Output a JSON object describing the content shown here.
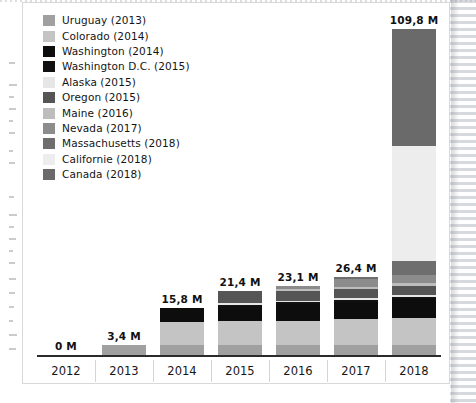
{
  "chart_data": {
    "type": "bar",
    "subtype": "stacked-bar",
    "title": "",
    "xlabel": "",
    "ylabel": "",
    "grid": false,
    "legend_position": "top-left",
    "ylim": [
      0,
      109.8
    ],
    "unit_suffix": " M",
    "decimal_separator": ",",
    "categories": [
      "2012",
      "2013",
      "2014",
      "2015",
      "2016",
      "2017",
      "2018"
    ],
    "totals": [
      0,
      3.4,
      15.8,
      21.4,
      23.1,
      26.4,
      109.8
    ],
    "total_labels": [
      "0 M",
      "3,4 M",
      "15,8 M",
      "21,4 M",
      "23,1 M",
      "26,4 M",
      "109,8 M"
    ],
    "series": [
      {
        "name": "Uruguay (2013)",
        "color": "#a0a0a0",
        "values": [
          0,
          3.4,
          3.4,
          3.4,
          3.4,
          3.4,
          3.4
        ]
      },
      {
        "name": "Colorado (2014)",
        "color": "#c4c4c4",
        "values": [
          0,
          0,
          7.6,
          7.9,
          8.2,
          8.6,
          9.0
        ]
      },
      {
        "name": "Washington (2014)",
        "color": "#0d0d0d",
        "values": [
          0,
          0,
          4.8,
          5.2,
          5.6,
          6.0,
          6.4
        ]
      },
      {
        "name": "Washington D.C. (2015)",
        "color": "#111111",
        "values": [
          0,
          0,
          0,
          0.5,
          0.5,
          0.5,
          0.6
        ]
      },
      {
        "name": "Alaska (2015)",
        "color": "#e6e6e6",
        "values": [
          0,
          0,
          0,
          0.5,
          0.6,
          0.7,
          0.8
        ]
      },
      {
        "name": "Oregon (2015)",
        "color": "#555555",
        "values": [
          0,
          0,
          0,
          3.9,
          3.4,
          3.1,
          3.2
        ]
      },
      {
        "name": "Maine (2016)",
        "color": "#bdbdbd",
        "values": [
          0,
          0,
          0,
          0,
          0.5,
          0.6,
          0.7
        ]
      },
      {
        "name": "Nevada (2017)",
        "color": "#8c8c8c",
        "values": [
          0,
          0,
          0,
          0,
          0.9,
          2.6,
          2.8
        ]
      },
      {
        "name": "Massachusetts (2018)",
        "color": "#6e6e6e",
        "values": [
          0,
          0,
          0,
          0,
          0,
          0.9,
          4.6
        ]
      },
      {
        "name": "Californie (2018)",
        "color": "#ededed",
        "values": [
          0,
          0,
          0,
          0,
          0,
          0,
          39.0
        ]
      },
      {
        "name": "Canada (2018)",
        "color": "#6a6a6a",
        "values": [
          0,
          0,
          0,
          0,
          0,
          0,
          39.3
        ]
      }
    ]
  },
  "legend": {
    "items": [
      {
        "label": "Uruguay (2013)",
        "color": "#a0a0a0"
      },
      {
        "label": "Colorado (2014)",
        "color": "#c4c4c4"
      },
      {
        "label": "Washington (2014)",
        "color": "#0d0d0d"
      },
      {
        "label": "Washington D.C. (2015)",
        "color": "#111111"
      },
      {
        "label": "Alaska (2015)",
        "color": "#e6e6e6"
      },
      {
        "label": "Oregon (2015)",
        "color": "#555555"
      },
      {
        "label": "Maine (2016)",
        "color": "#bdbdbd"
      },
      {
        "label": "Nevada (2017)",
        "color": "#8c8c8c"
      },
      {
        "label": "Massachusetts (2018)",
        "color": "#6e6e6e"
      },
      {
        "label": "Californie (2018)",
        "color": "#ededed"
      },
      {
        "label": "Canada (2018)",
        "color": "#6a6a6a"
      }
    ]
  },
  "axis": {
    "ticks": [
      "2012",
      "2013",
      "2014",
      "2015",
      "2016",
      "2017",
      "2018"
    ],
    "line_color": "#2b2b2b"
  }
}
